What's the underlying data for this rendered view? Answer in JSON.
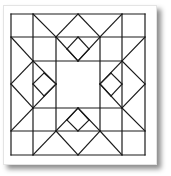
{
  "diagram": {
    "title": "",
    "type": "quilt-block",
    "stroke_color": "#1a1a1a",
    "background_color": "#ffffff",
    "grid": {
      "x": [
        11,
        33,
        56,
        78,
        100,
        122,
        145
      ],
      "y": [
        14,
        37,
        61,
        84,
        108,
        131,
        155
      ]
    },
    "lines": [
      [
        11,
        14,
        145,
        14
      ],
      [
        145,
        14,
        145,
        155
      ],
      [
        145,
        155,
        11,
        155
      ],
      [
        11,
        155,
        11,
        14
      ],
      [
        11,
        37,
        145,
        37
      ],
      [
        11,
        131,
        145,
        131
      ],
      [
        33,
        14,
        33,
        155
      ],
      [
        122,
        14,
        122,
        155
      ],
      [
        33,
        61,
        122,
        61
      ],
      [
        33,
        108,
        122,
        108
      ],
      [
        56,
        37,
        56,
        131
      ],
      [
        100,
        37,
        100,
        131
      ],
      [
        33,
        14,
        56,
        37
      ],
      [
        56,
        37,
        78,
        14
      ],
      [
        78,
        14,
        100,
        37
      ],
      [
        100,
        37,
        122,
        14
      ],
      [
        56,
        37,
        78,
        61
      ],
      [
        78,
        61,
        100,
        37
      ],
      [
        78,
        37,
        67,
        49
      ],
      [
        67,
        49,
        78,
        61
      ],
      [
        78,
        37,
        89,
        49
      ],
      [
        89,
        49,
        78,
        61
      ],
      [
        33,
        155,
        56,
        131
      ],
      [
        56,
        131,
        78,
        155
      ],
      [
        78,
        155,
        100,
        131
      ],
      [
        100,
        131,
        122,
        155
      ],
      [
        56,
        131,
        78,
        108
      ],
      [
        78,
        108,
        100,
        131
      ],
      [
        78,
        131,
        67,
        120
      ],
      [
        67,
        120,
        78,
        108
      ],
      [
        78,
        131,
        89,
        120
      ],
      [
        89,
        120,
        78,
        108
      ],
      [
        11,
        37,
        33,
        61
      ],
      [
        33,
        61,
        11,
        84
      ],
      [
        11,
        84,
        33,
        108
      ],
      [
        33,
        108,
        11,
        131
      ],
      [
        33,
        61,
        56,
        84
      ],
      [
        56,
        84,
        33,
        108
      ],
      [
        33,
        84,
        44,
        73
      ],
      [
        44,
        73,
        56,
        84
      ],
      [
        33,
        84,
        44,
        96
      ],
      [
        44,
        96,
        56,
        84
      ],
      [
        145,
        37,
        122,
        61
      ],
      [
        122,
        61,
        145,
        84
      ],
      [
        145,
        84,
        122,
        108
      ],
      [
        122,
        108,
        145,
        131
      ],
      [
        122,
        61,
        100,
        84
      ],
      [
        100,
        84,
        122,
        108
      ],
      [
        122,
        84,
        111,
        73
      ],
      [
        111,
        73,
        100,
        84
      ],
      [
        122,
        84,
        111,
        96
      ],
      [
        111,
        96,
        100,
        84
      ]
    ]
  }
}
